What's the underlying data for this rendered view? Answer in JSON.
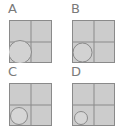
{
  "colors": {
    "cell_fill": "#cccccc",
    "grid_line": "#8a8a8a",
    "circle_stroke": "#8a8a8a",
    "label": "#7a7a7a"
  },
  "panels": [
    {
      "label": "A",
      "circle": {
        "cx": 11,
        "cy": 32,
        "r": 11.5
      }
    },
    {
      "label": "B",
      "circle": {
        "cx": 10.5,
        "cy": 32.5,
        "r": 9.5
      }
    },
    {
      "label": "C",
      "circle": {
        "cx": 10,
        "cy": 33,
        "r": 8.5
      }
    },
    {
      "label": "D",
      "circle": {
        "cx": 9,
        "cy": 35,
        "r": 6.5
      }
    }
  ]
}
